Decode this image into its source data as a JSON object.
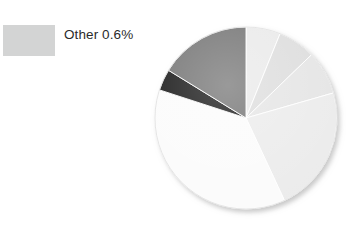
{
  "legend": {
    "entries": [
      {
        "label": "Other 0.6%",
        "color": "#d3d4d4",
        "value": 0.6
      }
    ]
  },
  "chart_data": {
    "type": "pie",
    "title": "",
    "legend_position": "left",
    "grid": false,
    "total": 100,
    "start_angle_deg": 0,
    "direction": "clockwise",
    "center": {
      "x": 97,
      "y": 97
    },
    "radius": 91,
    "categories": [
      "Slice 1",
      "Slice 2",
      "Slice 3",
      "Slice 4",
      "Slice 5",
      "Other",
      "Slice 7"
    ],
    "values": [
      6.1,
      6.7,
      7.8,
      22.5,
      37.0,
      3.8,
      16.1
    ],
    "colors": [
      "#e9e9e9",
      "#dcdcdc",
      "#e4e4e4",
      "#ebebeb",
      "#fbfbfb",
      "#0c0c0c",
      "#6e6e6e"
    ],
    "slices": [
      {
        "name": "Slice 1",
        "value": 6.1,
        "color": "#e9e9e9",
        "start_deg": 0.0,
        "end_deg": 22.0
      },
      {
        "name": "Slice 2",
        "value": 6.7,
        "color": "#dcdcdc",
        "start_deg": 22.0,
        "end_deg": 46.0
      },
      {
        "name": "Slice 3",
        "value": 7.8,
        "color": "#e4e4e4",
        "start_deg": 46.0,
        "end_deg": 74.0
      },
      {
        "name": "Slice 4",
        "value": 22.5,
        "color": "#ebebeb",
        "start_deg": 74.0,
        "end_deg": 155.0
      },
      {
        "name": "Slice 5",
        "value": 37.0,
        "color": "#fbfbfb",
        "start_deg": 155.0,
        "end_deg": 288.0
      },
      {
        "name": "Other",
        "value": 3.8,
        "color": "#0c0c0c",
        "start_deg": 288.0,
        "end_deg": 301.6
      },
      {
        "name": "Slice 7",
        "value": 16.1,
        "color": "#6e6e6e",
        "start_deg": 301.6,
        "end_deg": 360.0
      }
    ]
  }
}
